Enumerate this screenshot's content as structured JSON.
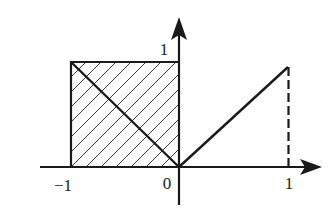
{
  "diagram": {
    "type": "function-graph",
    "colors": {
      "background": "#ffffff",
      "stroke": "#1a1a1a",
      "hatch": "#3a3a3a"
    },
    "axes": {
      "x_axis": {
        "from": -1.3,
        "to": 1.3,
        "arrow": true
      },
      "y_axis": {
        "from": -0.35,
        "to": 1.4,
        "arrow": true
      }
    },
    "labels": {
      "x_neg_one": "−1",
      "origin": "0",
      "x_one": "1",
      "y_one": "1"
    },
    "shapes": [
      {
        "name": "hatched-square",
        "x_range": [
          -1,
          0
        ],
        "y_range": [
          0,
          1
        ],
        "fill": "diagonal-hatch"
      },
      {
        "name": "segment-left",
        "from": [
          -1,
          1
        ],
        "to": [
          0,
          0
        ],
        "style": "solid"
      },
      {
        "name": "segment-right",
        "from": [
          0,
          0
        ],
        "to": [
          1,
          0.95
        ],
        "style": "solid"
      },
      {
        "name": "dashed-vertical",
        "from": [
          1,
          0.95
        ],
        "to": [
          1,
          0
        ],
        "style": "dashed"
      }
    ]
  }
}
